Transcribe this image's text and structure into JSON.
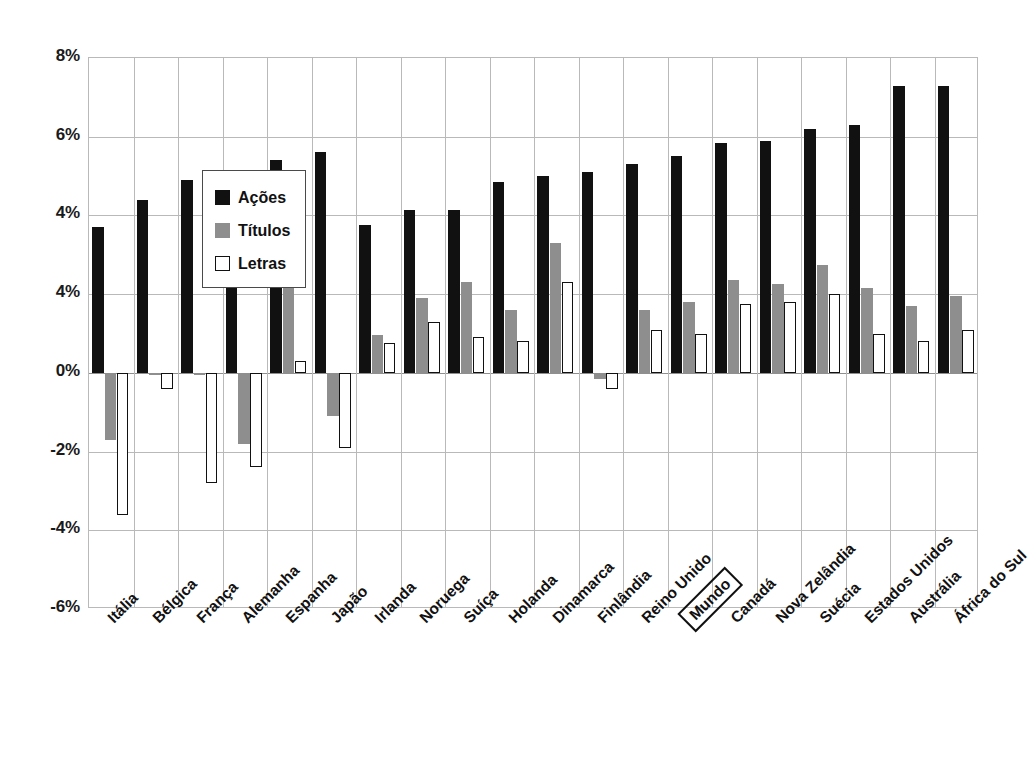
{
  "chart_data": {
    "type": "bar",
    "title": "",
    "xlabel": "",
    "ylabel": "",
    "ylim": [
      -6,
      8
    ],
    "grid": true,
    "legend_position": "top-left",
    "ytick_labels": [
      "8%",
      "6%",
      "4%",
      "4%",
      "0%",
      "-2%",
      "-4%",
      "-6%"
    ],
    "ytick_values": [
      8,
      6,
      4,
      2,
      0,
      -2,
      -4,
      -6
    ],
    "highlighted_category": "Mundo",
    "categories": [
      "Itália",
      "Bélgica",
      "França",
      "Alemanha",
      "Espanha",
      "Japão",
      "Irlanda",
      "Noruega",
      "Suíça",
      "Holanda",
      "Dinamarca",
      "Finlândia",
      "Reino Unido",
      "Mundo",
      "Canadá",
      "Nova Zelândia",
      "Suécia",
      "Estados Unidos",
      "Austrália",
      "África do Sul"
    ],
    "series": [
      {
        "name": "Ações",
        "color": "#111111",
        "values": [
          3.7,
          4.4,
          4.9,
          4.9,
          5.4,
          5.6,
          3.75,
          4.15,
          4.15,
          4.85,
          5.0,
          5.1,
          5.3,
          5.5,
          5.85,
          5.9,
          6.2,
          6.3,
          7.3,
          7.3
        ]
      },
      {
        "name": "Títulos",
        "color": "#8e8e8e",
        "values": [
          -1.7,
          -0.05,
          -0.05,
          -1.8,
          2.7,
          -1.1,
          0.95,
          1.9,
          2.3,
          1.6,
          3.3,
          -0.15,
          1.6,
          1.8,
          2.35,
          2.25,
          2.75,
          2.15,
          1.7,
          1.95
        ]
      },
      {
        "name": "Letras",
        "color": "#ffffff",
        "values": [
          -3.6,
          -0.4,
          -2.8,
          -2.4,
          0.3,
          -1.9,
          0.75,
          1.3,
          0.9,
          0.8,
          2.3,
          -0.4,
          1.1,
          1.0,
          1.75,
          1.8,
          2.0,
          1.0,
          0.8,
          1.1
        ]
      }
    ]
  },
  "legend": {
    "entries": [
      {
        "label": "Ações",
        "swatch": "acoes"
      },
      {
        "label": "Títulos",
        "swatch": "titulos"
      },
      {
        "label": "Letras",
        "swatch": "letras"
      }
    ]
  }
}
